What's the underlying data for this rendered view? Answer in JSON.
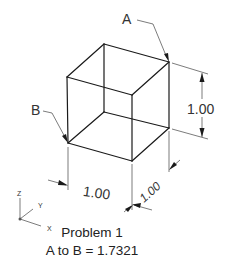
{
  "diagram": {
    "type": "isometric-cube-drawing",
    "points": {
      "A": {
        "label": "A"
      },
      "B": {
        "label": "B"
      }
    },
    "dimensions": {
      "height": "1.00",
      "width": "1.00",
      "depth": "1.00"
    },
    "triad": {
      "x": "X",
      "y": "Y",
      "z": "Z"
    },
    "caption": {
      "title": "Problem 1",
      "result": "A to B = 1.7321"
    },
    "colors": {
      "line": "#1a1a1a",
      "dim": "#444444",
      "background": "#ffffff"
    }
  }
}
